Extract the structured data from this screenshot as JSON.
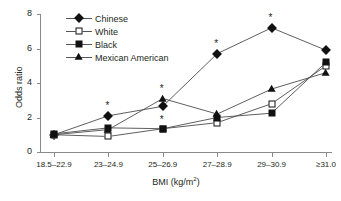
{
  "chart_data": {
    "type": "line",
    "title": "",
    "xlabel": "BMI (kg/m2)",
    "xlabel_base": "BMI (kg/m",
    "xlabel_sup": "2",
    "xlabel_tail": ")",
    "ylabel": "Odds ratio",
    "categories": [
      "18.5–22.9",
      "23–24.9",
      "25–26.9",
      "27–28.9",
      "29–30.9",
      "≥31.0"
    ],
    "ylim": [
      0,
      8
    ],
    "yticks": [
      0,
      2,
      4,
      6,
      8
    ],
    "grid": false,
    "legend_position": "top-left",
    "significance_marker": "*",
    "series": [
      {
        "name": "Chinese",
        "marker": "filled-diamond",
        "values": [
          1.0,
          2.1,
          2.65,
          5.7,
          7.2,
          5.9
        ],
        "significant": [
          false,
          true,
          true,
          true,
          true,
          false
        ]
      },
      {
        "name": "White",
        "marker": "open-square",
        "values": [
          1.0,
          0.9,
          1.35,
          1.7,
          2.8,
          5.0
        ],
        "significant": [
          false,
          false,
          false,
          false,
          false,
          false
        ]
      },
      {
        "name": "Black",
        "marker": "filled-square",
        "values": [
          1.05,
          1.4,
          1.35,
          2.0,
          2.25,
          5.2
        ],
        "significant": [
          false,
          false,
          false,
          false,
          false,
          false
        ]
      },
      {
        "name": "Mexican American",
        "marker": "filled-triangle",
        "values": [
          1.0,
          1.3,
          3.1,
          2.2,
          3.65,
          4.6
        ],
        "significant": [
          false,
          false,
          true,
          false,
          false,
          false
        ]
      }
    ]
  }
}
